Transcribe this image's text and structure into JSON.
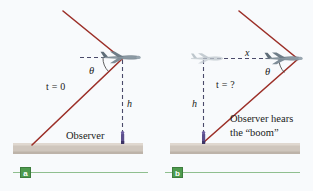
{
  "figure": {
    "background_color": "#f8fafc",
    "ground_color": "#cfc6bd",
    "wave_color": "#9c2f28",
    "plane_color": "#7c8b95",
    "plane_ghost_color": "#b9c2c8",
    "observer_color": "#5b4e8c",
    "dashed_color": "#4a4a6a",
    "badge_color": "#4e9b4e",
    "badge_line_color": "#8fbf8f"
  },
  "panel_a": {
    "badge": "a",
    "time_label": "t = 0",
    "angle_label": "θ",
    "height_label": "h",
    "observer_label": "Observer",
    "icons": {
      "plane": "airplane-icon",
      "observer": "observer-person-icon",
      "ground": "ground-bar",
      "shock_wave": "shock-wave-cone"
    }
  },
  "panel_b": {
    "badge": "b",
    "time_label": "t = ?",
    "angle_label": "θ",
    "height_label": "h",
    "distance_label": "x",
    "observer_line1": "Observer hears",
    "observer_line2": "the “boom”",
    "icons": {
      "plane": "airplane-icon",
      "plane_ghost": "airplane-ghost-icon",
      "observer": "observer-person-icon",
      "ground": "ground-bar",
      "shock_wave": "shock-wave-cone"
    }
  }
}
